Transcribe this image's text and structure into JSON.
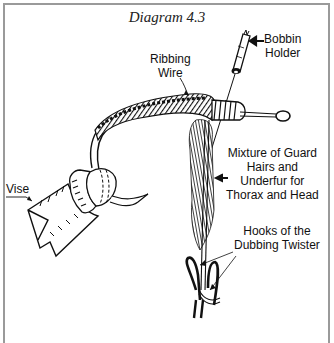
{
  "diagram": {
    "title": "Diagram 4.3",
    "labels": {
      "bobbin_holder": [
        "Bobbin",
        "Holder"
      ],
      "ribbing_wire": [
        "Ribbing",
        "Wire"
      ],
      "mixture": [
        "Mixture of Guard",
        "Hairs and",
        "Underfur for",
        "Thorax and Head"
      ],
      "vise": "Vise",
      "hooks": [
        "Hooks of the",
        "Dubbing Twister"
      ]
    },
    "colors": {
      "frame": "#9a9a9a",
      "ink": "#111111",
      "background": "#ffffff"
    }
  }
}
